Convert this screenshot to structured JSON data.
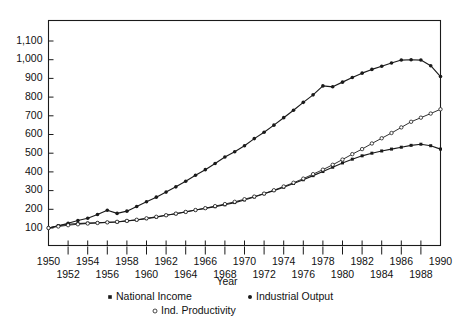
{
  "chart_data": {
    "type": "line",
    "title": "",
    "xlabel": "Year",
    "ylabel": "",
    "grid": false,
    "legend_position": "bottom",
    "xlim": [
      1950,
      1990
    ],
    "ylim": [
      0,
      1150
    ],
    "yticks": [
      100,
      200,
      300,
      400,
      500,
      600,
      700,
      800,
      900,
      1000,
      1100
    ],
    "ytick_labels": [
      "100",
      "200",
      "300",
      "400",
      "500",
      "600",
      "700",
      "800",
      "900",
      "1,000",
      "1,100"
    ],
    "xticks": [
      1950,
      1952,
      1954,
      1956,
      1958,
      1960,
      1962,
      1964,
      1966,
      1968,
      1970,
      1972,
      1974,
      1976,
      1978,
      1980,
      1982,
      1984,
      1986,
      1988,
      1990
    ],
    "xtick_labels_row1": [
      "1950",
      "1954",
      "1958",
      "1962",
      "1966",
      "1970",
      "1974",
      "1978",
      "1982",
      "1986",
      "1990"
    ],
    "xtick_labels_row2": [
      "1952",
      "1956",
      "1960",
      "1964",
      "1968",
      "1972",
      "1976",
      "1980",
      "1984",
      "1988"
    ],
    "x": [
      1950,
      1951,
      1952,
      1953,
      1954,
      1955,
      1956,
      1957,
      1958,
      1959,
      1960,
      1961,
      1962,
      1963,
      1964,
      1965,
      1966,
      1967,
      1968,
      1969,
      1970,
      1971,
      1972,
      1973,
      1974,
      1975,
      1976,
      1977,
      1978,
      1979,
      1980,
      1981,
      1982,
      1983,
      1984,
      1985,
      1986,
      1987,
      1988,
      1989,
      1990
    ],
    "series": [
      {
        "name": "National Income",
        "marker": "filled-square",
        "values": [
          100,
          112,
          120,
          124,
          126,
          128,
          130,
          132,
          138,
          143,
          150,
          158,
          168,
          176,
          186,
          196,
          205,
          214,
          224,
          236,
          250,
          266,
          283,
          300,
          318,
          338,
          358,
          380,
          402,
          425,
          448,
          468,
          486,
          500,
          512,
          522,
          532,
          542,
          548,
          540,
          522
        ]
      },
      {
        "name": "Industrial Output",
        "marker": "filled-dot",
        "values": [
          100,
          112,
          125,
          140,
          152,
          172,
          195,
          178,
          190,
          215,
          240,
          265,
          292,
          320,
          350,
          382,
          412,
          445,
          480,
          508,
          540,
          578,
          612,
          650,
          690,
          730,
          772,
          812,
          860,
          855,
          880,
          905,
          928,
          948,
          965,
          982,
          998,
          1000,
          998,
          968,
          910
        ]
      },
      {
        "name": "Ind. Productivity",
        "marker": "open-circle",
        "values": [
          100,
          108,
          115,
          120,
          124,
          127,
          130,
          133,
          138,
          144,
          152,
          160,
          168,
          177,
          186,
          196,
          206,
          217,
          228,
          240,
          254,
          268,
          284,
          302,
          322,
          342,
          364,
          388,
          412,
          438,
          466,
          495,
          522,
          552,
          580,
          608,
          638,
          668,
          690,
          712,
          735
        ]
      }
    ]
  },
  "legend": {
    "items": [
      {
        "label": "National Income",
        "marker": "filled-square"
      },
      {
        "label": "Industrial Output",
        "marker": "filled-dot"
      },
      {
        "label": "Ind. Productivity",
        "marker": "open-circle"
      }
    ]
  },
  "colors": {
    "ink": "#1a1a1a",
    "background": "#ffffff"
  }
}
